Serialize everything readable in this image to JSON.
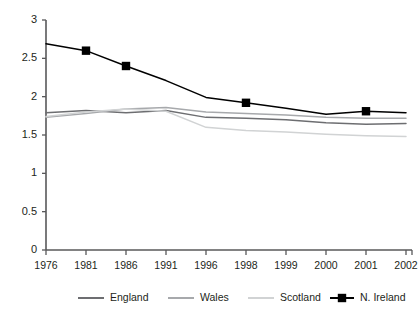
{
  "chart_data": {
    "type": "line",
    "title": "",
    "subtitle": "",
    "xlabel": "",
    "ylabel": "",
    "x": [
      "1976",
      "1981",
      "1986",
      "1991",
      "1996",
      "1998",
      "1999",
      "2000",
      "2001",
      "2002"
    ],
    "categories": [
      "1976",
      "1981",
      "1986",
      "1991",
      "1996",
      "1998",
      "1999",
      "2000",
      "2001",
      "2002"
    ],
    "xtick_labels": [
      "1976",
      "1981",
      "1986",
      "1991",
      "1996",
      "1998",
      "1999",
      "2000",
      "2001",
      "2002"
    ],
    "ytick_labels": [
      "0",
      "0.5",
      "1",
      "1.5",
      "2",
      "2.5",
      "3"
    ],
    "ytick_values": [
      0,
      0.5,
      1,
      1.5,
      2,
      2.5,
      3
    ],
    "ylim": [
      0,
      3
    ],
    "grid": false,
    "legend_position": "bottom",
    "series": [
      {
        "name": "England",
        "color": "#6d6e71",
        "marker": "none",
        "values": [
          1.79,
          1.82,
          1.79,
          1.82,
          1.73,
          1.72,
          1.7,
          1.66,
          1.64,
          1.65
        ]
      },
      {
        "name": "Wales",
        "color": "#a7a9ac",
        "marker": "none",
        "values": [
          1.73,
          1.78,
          1.84,
          1.86,
          1.8,
          1.78,
          1.76,
          1.73,
          1.72,
          1.72
        ]
      },
      {
        "name": "Scotland",
        "color": "#d1d3d4",
        "marker": "none",
        "values": [
          1.74,
          1.8,
          1.84,
          1.81,
          1.6,
          1.56,
          1.54,
          1.51,
          1.49,
          1.48
        ]
      },
      {
        "name": "N. Ireland",
        "color": "#000000",
        "marker": "square",
        "values": [
          2.69,
          2.6,
          2.4,
          2.21,
          1.99,
          1.92,
          1.85,
          1.77,
          1.81,
          1.79
        ],
        "marker_points": [
          {
            "x": "1981",
            "y": 2.6
          },
          {
            "x": "1986",
            "y": 2.4
          },
          {
            "x": "1998",
            "y": 1.92
          },
          {
            "x": "2001",
            "y": 1.81
          }
        ]
      }
    ],
    "legend": [
      {
        "label": "England",
        "color": "#6d6e71",
        "marker": "none"
      },
      {
        "label": "Wales",
        "color": "#a7a9ac",
        "marker": "none"
      },
      {
        "label": "Scotland",
        "color": "#d1d3d4",
        "marker": "none"
      },
      {
        "label": "N. Ireland",
        "color": "#000000",
        "marker": "square"
      }
    ]
  },
  "caption": {
    "text": ""
  },
  "colors": {
    "axis": "#58585a",
    "text": "#231f20",
    "background": "#ffffff"
  }
}
